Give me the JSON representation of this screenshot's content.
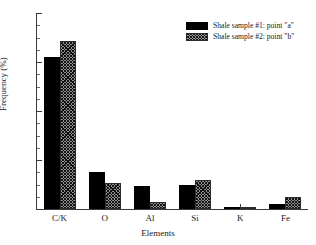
{
  "chart_data": {
    "type": "bar",
    "title": "",
    "xlabel": "Elements",
    "ylabel": "Frequency (%)",
    "categories": [
      "C/K",
      "O",
      "Al",
      "Si",
      "K",
      "Fe"
    ],
    "series": [
      {
        "name": "Shale sample #1: point \"a\"",
        "values": [
          62,
          15,
          9.5,
          10,
          0.8,
          2
        ],
        "style": "solid-black",
        "color": "#000000"
      },
      {
        "name": "Shale sample #2: point \"b\"",
        "values": [
          68.5,
          10.5,
          3,
          12,
          0.8,
          5
        ],
        "style": "crosshatch-gray",
        "color": "#8f8f8f"
      }
    ],
    "ylim": [
      0,
      80
    ],
    "yticks": [
      0,
      20,
      40,
      60,
      80
    ],
    "ytick_labels": [
      "0",
      "20",
      "40",
      "60",
      "80"
    ],
    "y_minor_tick_count": 3,
    "grid": false,
    "legend_position": "top-right",
    "axis_color": "#3a3a3a"
  },
  "legend": {
    "entries": [
      {
        "label": "Shale sample #1: point \"a\""
      },
      {
        "label": "Shale sample #2: point \"b\""
      }
    ]
  }
}
